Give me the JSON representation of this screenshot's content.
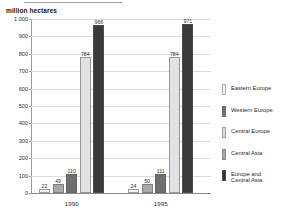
{
  "axis_title": "million hectares",
  "chart_data": {
    "type": "bar",
    "title": "",
    "subtitle": "",
    "xlabel": "",
    "ylabel": "million hectares",
    "ylim": [
      0,
      1000
    ],
    "yticks": [
      "0",
      "100",
      "200",
      "300",
      "400",
      "500",
      "600",
      "700",
      "800",
      "900",
      "1 000"
    ],
    "ytick_values": [
      0,
      100,
      200,
      300,
      400,
      500,
      600,
      700,
      800,
      900,
      1000
    ],
    "grid": true,
    "legend_position": "right",
    "categories": [
      "1990",
      "1995"
    ],
    "series": [
      {
        "name": "Eastern Europe",
        "color": "#f2f2f2",
        "values": [
          22,
          24
        ]
      },
      {
        "name": "Western Europe",
        "color": "#a8a8a8",
        "values": [
          49,
          50
        ]
      },
      {
        "name": "Central Europe",
        "color": "#6e6e6e",
        "values": [
          110,
          111
        ]
      },
      {
        "name": "Central Asia",
        "color": "#e2e2e2",
        "values": [
          784,
          784
        ]
      },
      {
        "name": "Europe and Central Asia",
        "color": "#3a3a3a",
        "values": [
          966,
          971
        ]
      }
    ],
    "bar_labels": {
      "1990": [
        "22",
        "49",
        "110",
        "784",
        "966"
      ],
      "1995": [
        "24",
        "50",
        "111",
        "784",
        "971"
      ]
    }
  },
  "legend": {
    "items": [
      {
        "label": "Eastern Europe",
        "color": "#f2f2f2"
      },
      {
        "label": "Western Europe",
        "color": "#6e6e6e"
      },
      {
        "label": "Central Europe",
        "color": "#d8d8d8"
      },
      {
        "label": "Central Asia",
        "color": "#a8a8a8"
      },
      {
        "label": "Europe and\nCentral Asia",
        "color": "#333333"
      }
    ]
  }
}
